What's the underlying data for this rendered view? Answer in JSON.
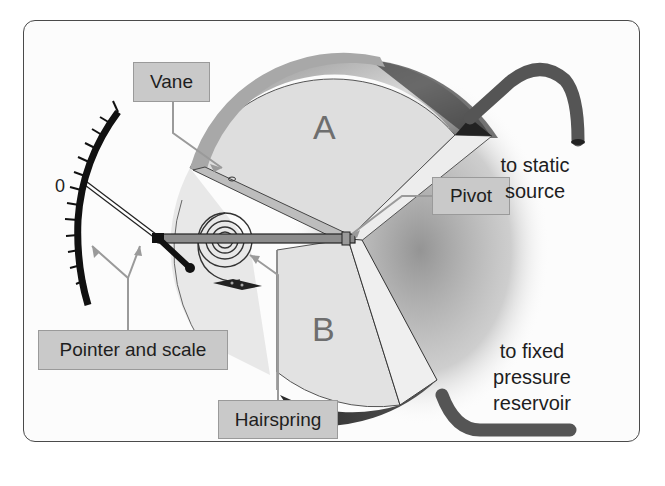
{
  "diagram": {
    "chambers": [
      {
        "id": "A",
        "label": "A"
      },
      {
        "id": "B",
        "label": "B"
      }
    ],
    "scale": {
      "zero_label": "0",
      "tick_count": 13
    },
    "callouts": [
      {
        "id": "vane",
        "label": "Vane"
      },
      {
        "id": "pivot",
        "label": "Pivot"
      },
      {
        "id": "pointer-and-scale",
        "label": "Pointer and scale"
      },
      {
        "id": "hairspring",
        "label": "Hairspring"
      }
    ],
    "connections": {
      "static": {
        "line1": "to static",
        "line2": "source"
      },
      "reservoir": {
        "line1": "to fixed",
        "line2": "pressure",
        "line3": "reservoir"
      }
    },
    "colors": {
      "callout_fill": "#c9c9c9",
      "callout_border": "#9a9a9a",
      "disc_face": "#dcdcdc",
      "disc_rim": "#9e9e9e",
      "tube": "#555555",
      "leader": "#9a9a9a",
      "frame": "#4a4a4a"
    }
  }
}
